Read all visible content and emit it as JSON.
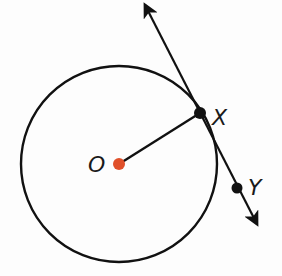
{
  "diagram": {
    "type": "circle-tangent",
    "colors": {
      "stroke": "#111111",
      "center_point": "#e0502a",
      "point": "#111111",
      "background": "#fdfdfd"
    },
    "circle": {
      "center_label": "O",
      "cx": 119,
      "cy": 164,
      "r": 98
    },
    "points": [
      {
        "label": "O",
        "x": 119,
        "y": 164,
        "role": "center"
      },
      {
        "label": "X",
        "x": 200,
        "y": 113,
        "role": "point-of-tangency"
      },
      {
        "label": "Y",
        "x": 237,
        "y": 188,
        "role": "point-on-tangent"
      }
    ],
    "segments": [
      {
        "from": "O",
        "to": "X",
        "type": "radius"
      }
    ],
    "lines": [
      {
        "through": [
          "X",
          "Y"
        ],
        "type": "tangent-line",
        "arrows": "both"
      }
    ],
    "labels": {
      "O": "O",
      "X": "X",
      "Y": "Y"
    }
  }
}
